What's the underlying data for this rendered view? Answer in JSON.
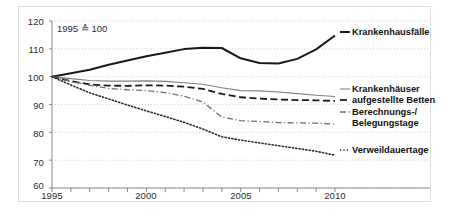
{
  "figure": {
    "note": "1995 ≙ 100",
    "background": "#ffffff",
    "frame_color": "#dcdcdc"
  },
  "axes": {
    "y_ticks": [
      "60",
      "70",
      "80",
      "90",
      "100",
      "110",
      "120"
    ],
    "x_ticks": [
      "1995",
      "2000",
      "2005",
      "2010"
    ]
  },
  "series_labels": {
    "krankenhausfaelle": "Krankenhausfälle",
    "krankenhaeuser_line1": "Krankenhäuser",
    "krankenhaeuser_line2": "aufgestellte Betten",
    "berechnungstage_line1": "Berechnungs-/",
    "berechnungstage_line2": "Belegungstage",
    "verweildauertage": "Verweildauertage"
  },
  "chart_data": {
    "type": "line",
    "title": "",
    "subtitle": "",
    "annotation": "1995 ≙ 100",
    "xlabel": "",
    "ylabel": "",
    "xlim": [
      1995,
      2010
    ],
    "ylim": [
      60,
      120
    ],
    "ytick_values": [
      60,
      70,
      80,
      90,
      100,
      110,
      120
    ],
    "xtick_values": [
      1995,
      2000,
      2005,
      2010
    ],
    "xtick_minor_every": 1,
    "grid": "horizontal-dotted",
    "legend_position": "right-inline",
    "x": [
      1995,
      1996,
      1997,
      1998,
      1999,
      2000,
      2001,
      2002,
      2003,
      2004,
      2005,
      2006,
      2007,
      2008,
      2009,
      2010
    ],
    "series": [
      {
        "name": "Krankenhausfälle",
        "style": "solid",
        "color": "#1a1a1a",
        "width": 2.0,
        "values": [
          100.0,
          101.2,
          102.5,
          104.3,
          105.8,
          107.3,
          108.6,
          109.9,
          110.4,
          110.3,
          106.6,
          104.9,
          104.7,
          106.4,
          109.8,
          114.8
        ]
      },
      {
        "name": "Krankenhäuser",
        "style": "solid",
        "color": "#808080",
        "width": 1.1,
        "values": [
          100.0,
          99.3,
          98.6,
          98.4,
          98.4,
          98.5,
          98.3,
          97.8,
          97.3,
          96.0,
          95.0,
          94.9,
          94.5,
          93.9,
          93.3,
          92.9
        ]
      },
      {
        "name": "aufgestellte Betten",
        "style": "dashed",
        "color": "#1a1a1a",
        "width": 1.8,
        "values": [
          100.0,
          98.4,
          97.2,
          96.8,
          96.7,
          96.9,
          96.8,
          96.4,
          95.6,
          93.8,
          92.6,
          92.1,
          91.8,
          91.6,
          91.5,
          91.3
        ]
      },
      {
        "name": "Berechnungs-/ Belegungstage",
        "style": "dashdot",
        "color": "#6f6f6f",
        "width": 1.3,
        "values": [
          100.0,
          98.3,
          96.9,
          95.8,
          95.3,
          95.0,
          94.3,
          93.0,
          90.9,
          85.5,
          84.2,
          83.9,
          83.5,
          83.4,
          83.3,
          83.0
        ]
      },
      {
        "name": "Verweildauertage",
        "style": "dotted",
        "color": "#2b2b2b",
        "width": 1.6,
        "values": [
          100.0,
          97.0,
          94.2,
          92.0,
          89.8,
          87.7,
          85.7,
          83.6,
          81.2,
          78.4,
          77.2,
          76.2,
          75.2,
          74.2,
          73.2,
          71.8
        ]
      }
    ]
  }
}
